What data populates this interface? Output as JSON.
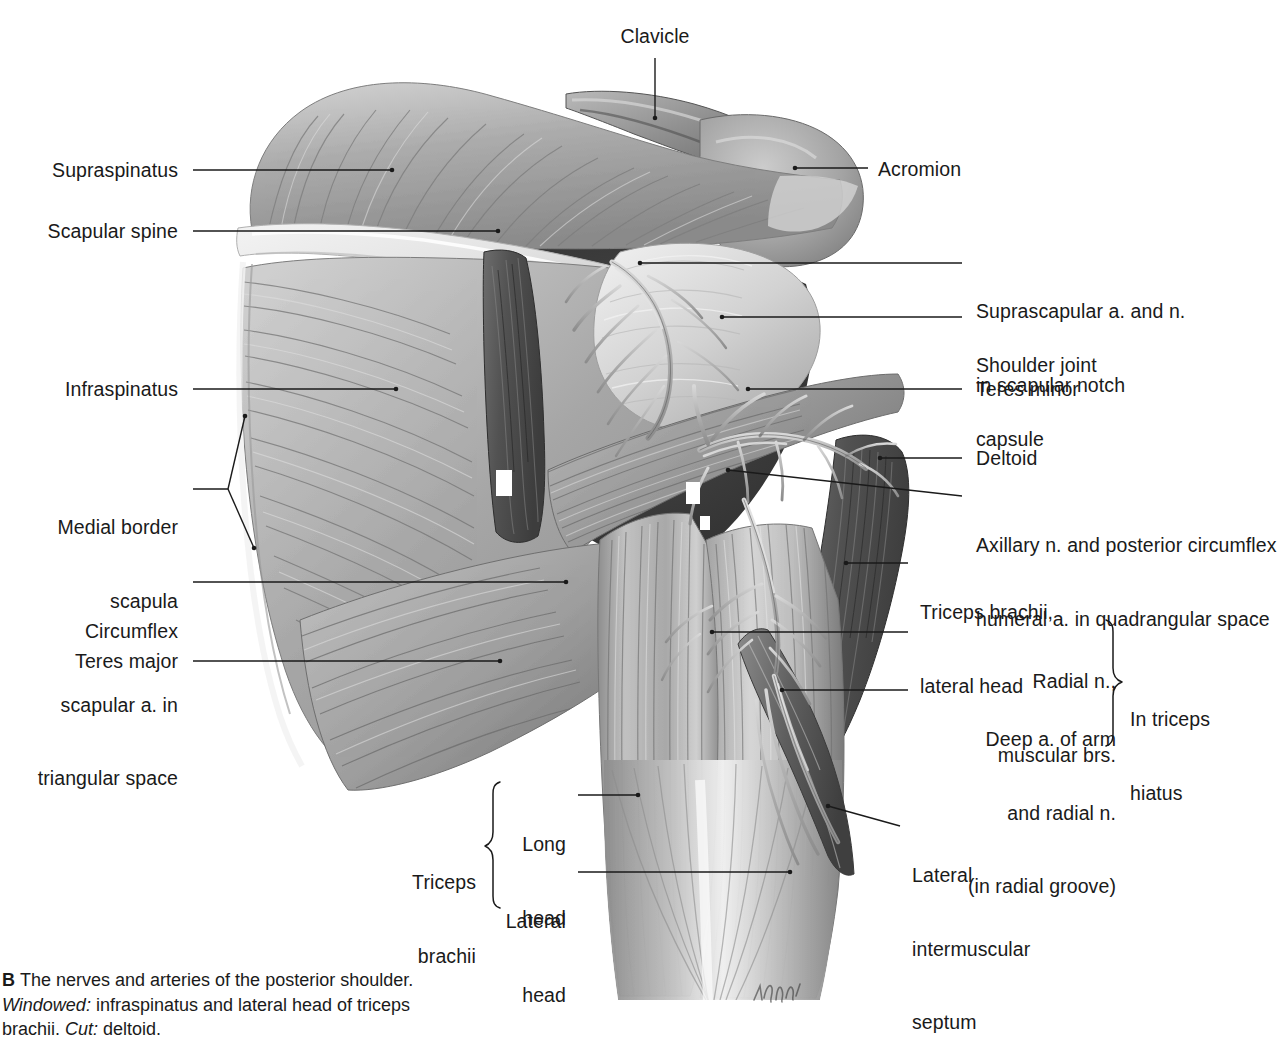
{
  "figure": {
    "letter": "B",
    "caption_part1": "The nerves and arteries of the posterior shoulder. ",
    "caption_em1": "Windowed:",
    "caption_part2": " infraspinatus and lateral head of triceps brachii. ",
    "caption_em2": "Cut:",
    "caption_part3": " deltoid.",
    "artist_signature": "K. Wesker"
  },
  "labels": {
    "clavicle": "Clavicle",
    "acromion": "Acromion",
    "supraspinatus": "Supraspinatus",
    "scapular_spine": "Scapular spine",
    "infraspinatus": "Infraspinatus",
    "medial_border_scapula_l1": "Medial border",
    "medial_border_scapula_l2": "scapula",
    "circumflex_l1": "Circumflex",
    "circumflex_l2": "scapular a. in",
    "circumflex_l3": "triangular space",
    "teres_major": "Teres major",
    "suprascapular_l1": "Suprascapular a. and n.",
    "suprascapular_l2": "in scapular notch",
    "shoulder_joint_l1": "Shoulder joint",
    "shoulder_joint_l2": "capsule",
    "teres_minor": "Teres minor",
    "deltoid": "Deltoid",
    "axillary_l1": "Axillary n. and posterior circumflex",
    "axillary_l2": "humeral a. in quadrangular space",
    "triceps_lateral_head_l1": "Triceps brachii,",
    "triceps_lateral_head_l2": "lateral head",
    "radial_n_l1": "Radial n.,",
    "radial_n_l2": "muscular brs.",
    "deep_a_l1": "Deep a. of arm",
    "deep_a_l2": "and radial n.",
    "deep_a_l3": "(in radial groove)",
    "in_triceps_hiatus_l1": "In triceps",
    "in_triceps_hiatus_l2": "hiatus",
    "triceps_brachii_l1": "Triceps",
    "triceps_brachii_l2": "brachii",
    "long_head_l1": "Long",
    "long_head_l2": "head",
    "lateral_head_l1": "Lateral",
    "lateral_head_l2": "head",
    "lat_intermuscular_l1": "Lateral",
    "lat_intermuscular_l2": "intermuscular",
    "lat_intermuscular_l3": "septum"
  },
  "colors": {
    "background": "#ffffff",
    "text": "#1a1a1a",
    "leader": "#1a1a1a",
    "muscle_light": "#c9c9c9",
    "muscle_mid": "#9b9b9b",
    "muscle_dark": "#6e6e6e",
    "bone_light": "#ececec",
    "deep_shadow": "#3a3a3a",
    "cut_muscle": "#555555",
    "vessel": "#b5b5b5"
  }
}
